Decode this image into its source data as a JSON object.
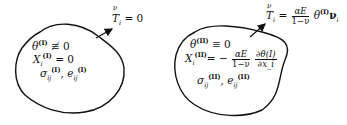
{
  "diagram": {
    "type": "two-body thermoelastic decomposition",
    "left_body": {
      "boundary_condition": {
        "lhs": "T",
        "lhs_over": "ν",
        "sub": "i",
        "rhs": "= 0"
      },
      "field_lines": [
        {
          "symbol": "θ",
          "sup": "(I)",
          "rel": "≢ 0"
        },
        {
          "symbol": "X",
          "sub": "i",
          "sup": "(I)",
          "rel": "= 0"
        },
        {
          "symbol1": "σ",
          "sub1": "ij",
          "sup1": "(I)",
          "sep": ",",
          "symbol2": "e",
          "sub2": "ij",
          "sup2": "(I)"
        }
      ]
    },
    "right_body": {
      "boundary_condition": {
        "lhs": "T",
        "lhs_over": "ν",
        "sub": "i",
        "eq": "=",
        "frac_num": "αE",
        "frac_den": "1−ν",
        "tail": "θ",
        "tail_sup": "(I)",
        "tail_vec": "ν",
        "tail_sub": "i"
      },
      "field_lines": [
        {
          "symbol": "θ",
          "sup": "(II)",
          "rel": "≡ 0"
        },
        {
          "symbol": "X",
          "sub": "i",
          "sup": "(II)",
          "rel": "= −",
          "frac1_num": "αE",
          "frac1_den": "1−ν",
          "frac2_num": "∂θ(I)",
          "frac2_den": "∂x_i"
        },
        {
          "symbol1": "σ",
          "sub1": "ij",
          "sup1": "(II)",
          "sep": ",",
          "symbol2": "e",
          "sub2": "ij",
          "sup2": "(II)"
        }
      ]
    },
    "colors": {
      "ink": "#111111",
      "background": "#ffffff"
    }
  }
}
